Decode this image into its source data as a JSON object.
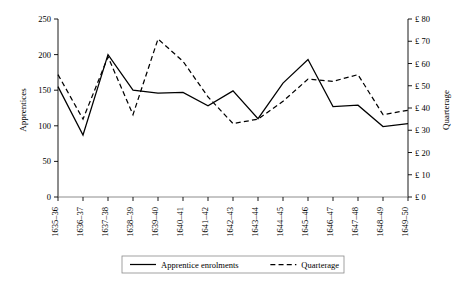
{
  "chart_data": {
    "type": "line",
    "title": "",
    "xlabel": "",
    "categories": [
      "1635–36",
      "1636–37",
      "1637–38",
      "1638–39",
      "1639–40",
      "1640–41",
      "1641–42",
      "1642–43",
      "1643–44",
      "1644–45",
      "1645–46",
      "1646–47",
      "1647–48",
      "1648–49",
      "1649–50"
    ],
    "grid": false,
    "legend_position": "bottom",
    "axes": {
      "left": {
        "label": "Apprentices",
        "ylim": [
          0,
          250
        ],
        "tick_step": 50,
        "ticks": [
          0,
          50,
          100,
          150,
          200,
          250
        ],
        "tick_labels": [
          "0",
          "50",
          "100",
          "150",
          "200",
          "250"
        ]
      },
      "right": {
        "label": "Quarterage",
        "ylim": [
          0,
          80
        ],
        "tick_step": 10,
        "ticks": [
          0,
          10,
          20,
          30,
          40,
          50,
          60,
          70,
          80
        ],
        "tick_labels": [
          "£ 0",
          "£ 10",
          "£ 20",
          "£ 30",
          "£ 40",
          "£ 50",
          "£ 60",
          "£ 70",
          "£ 80"
        ]
      }
    },
    "series": [
      {
        "name": "Apprentice enrolments",
        "axis": "left",
        "style": "solid",
        "color": "#000000",
        "values": [
          155,
          87,
          200,
          150,
          146,
          147,
          128,
          149,
          110,
          160,
          193,
          127,
          129,
          99,
          103
        ]
      },
      {
        "name": "Quarterage",
        "axis": "right",
        "style": "dashed",
        "color": "#000000",
        "values": [
          55,
          35,
          63,
          37,
          71,
          61,
          45,
          33,
          35,
          43,
          53,
          52,
          55,
          37,
          39
        ]
      }
    ]
  },
  "legend": {
    "items": [
      {
        "label": "Apprentice enrolments",
        "style": "solid"
      },
      {
        "label": "Quarterage",
        "style": "dashed"
      }
    ]
  }
}
